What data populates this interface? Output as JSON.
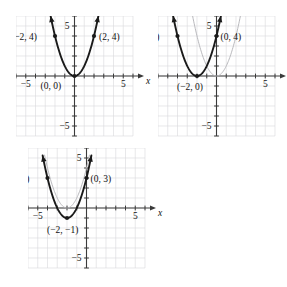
{
  "figure": {
    "background_color": "#ffffff",
    "grid_color": "#d8d8dc",
    "axis_color": "#3a3a3a",
    "curve_color": "#1a1a1a",
    "reference_curve_color": "#b9b9bd",
    "point_color": "#1a1a1a"
  },
  "chart_data": [
    {
      "id": "panel-1",
      "type": "line",
      "title": "",
      "xlabel": "x",
      "ylabel": "y",
      "xlim": [
        -6,
        6
      ],
      "ylim": [
        -6,
        6
      ],
      "grid": true,
      "legend": "none",
      "x_tick_labels": [
        {
          "value": -5,
          "text": "−5"
        },
        {
          "value": 5,
          "text": "5"
        }
      ],
      "y_tick_labels": [
        {
          "value": 5,
          "text": "5"
        },
        {
          "value": -5,
          "text": "−5"
        }
      ],
      "series": [
        {
          "name": "y = x^2",
          "style": "solid-bold",
          "equation_a": 1,
          "equation_h": 0,
          "equation_k": 0,
          "x_start": -2.45,
          "x_end": 2.45,
          "arrows": "both"
        }
      ],
      "points": [
        {
          "x": -2,
          "y": 4,
          "label": "(−2, 4)",
          "label_dx": -44,
          "label_dy": 4
        },
        {
          "x": 0,
          "y": 0,
          "label": "(0, 0)",
          "label_dx": -34,
          "label_dy": 13
        },
        {
          "x": 2,
          "y": 4,
          "label": "(2, 4)",
          "label_dx": 5,
          "label_dy": 4
        }
      ]
    },
    {
      "id": "panel-2",
      "type": "line",
      "title": "",
      "xlabel": "x",
      "ylabel": "y",
      "xlim": [
        -6,
        6
      ],
      "ylim": [
        -6,
        6
      ],
      "grid": true,
      "legend": "none",
      "x_tick_labels": [
        {
          "value": 5,
          "text": "5"
        }
      ],
      "y_tick_labels": [
        {
          "value": 5,
          "text": "5"
        },
        {
          "value": -5,
          "text": "−5"
        }
      ],
      "series": [
        {
          "name": "y = x^2",
          "style": "solid-light",
          "equation_a": 1,
          "equation_h": 0,
          "equation_k": 0,
          "x_start": -2.45,
          "x_end": 2.45,
          "arrows": "none"
        },
        {
          "name": "y = (x + 2)^2",
          "style": "solid-bold",
          "equation_a": 1,
          "equation_h": -2,
          "equation_k": 0,
          "x_start": -4.45,
          "x_end": 0.45,
          "arrows": "both"
        }
      ],
      "points": [
        {
          "x": -4,
          "y": 4,
          "label": "(−4, 4)",
          "label_dx": -44,
          "label_dy": 4
        },
        {
          "x": -2,
          "y": 0,
          "label": "(−2, 0)",
          "label_dx": -20,
          "label_dy": 14
        },
        {
          "x": 0,
          "y": 4,
          "label": "(0, 4)",
          "label_dx": 4,
          "label_dy": 4
        }
      ]
    },
    {
      "id": "panel-3",
      "type": "line",
      "title": "",
      "xlabel": "x",
      "ylabel": "y",
      "xlim": [
        -6,
        6
      ],
      "ylim": [
        -6,
        6
      ],
      "grid": true,
      "legend": "none",
      "x_tick_labels": [
        {
          "value": -5,
          "text": "−5"
        },
        {
          "value": 5,
          "text": "5"
        }
      ],
      "y_tick_labels": [
        {
          "value": 5,
          "text": "5"
        },
        {
          "value": -5,
          "text": "−5"
        }
      ],
      "series": [
        {
          "name": "y = (x + 2)^2",
          "style": "solid-light",
          "equation_a": 1,
          "equation_h": -2,
          "equation_k": 0,
          "x_start": -4.3,
          "x_end": 0.3,
          "arrows": "none"
        },
        {
          "name": "y = (x + 2)^2 - 1",
          "style": "solid-bold",
          "equation_a": 1,
          "equation_h": -2,
          "equation_k": -1,
          "x_start": -4.5,
          "x_end": 0.5,
          "arrows": "both"
        }
      ],
      "points": [
        {
          "x": -4,
          "y": 3,
          "label": "(−4, 3)",
          "label_dx": -44,
          "label_dy": 4
        },
        {
          "x": -2,
          "y": -1,
          "label": "(−2, −1)",
          "label_dx": -20,
          "label_dy": 15
        },
        {
          "x": 0,
          "y": 3,
          "label": "(0, 3)",
          "label_dx": 4,
          "label_dy": 4
        }
      ]
    }
  ]
}
